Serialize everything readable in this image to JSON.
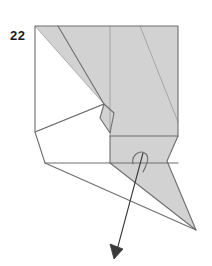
{
  "diagram": {
    "kind": "origami-folding-step",
    "step_number": "22",
    "caption": "",
    "colors": {
      "paper_front": "#d2d2d2",
      "paper_back": "#ffffff",
      "fold_line": "#6e6e6e",
      "crease_line": "#9a9a9a",
      "outline": "#555555",
      "arrow": "#3a3a3a",
      "background": "#ffffff",
      "number_text": "#1a1a1a"
    },
    "shapes": {
      "body_upper_gray": "35,26 178,26 178,136 110,136 110,111 104,104",
      "body_left_white": "35,26 35,132 45,163 110,163 110,136 104,104",
      "body_lower_gray": "110,136 178,136 167,161 196,230 110,163",
      "tail_white": "45,163 196,230 110,163",
      "upper_left_gray_wedge": "35,26 104,104 58,26",
      "diamond_flap": "104,104 114,112 110,133 100,118",
      "hook_flap": "133,163 141,152 148,157 143,164"
    },
    "lines": {
      "outline_main": "35,26 178,26 178,136 167,161 196,230 45,163 35,132 35,26",
      "crease_vertical": "110,26 110,163",
      "crease_diag_upper": "58,26 110,136",
      "crease_diag_right": "140,26 178,120",
      "crease_left_fan_a": "35,26 35,132",
      "crease_left_fan_b": "35,132 104,104",
      "crease_left_fan_c": "35,26 104,104",
      "crease_tail_edge": "45,163 196,230",
      "crease_tail_inner": "110,163 196,230",
      "horizontal_mid": "35,132 110,136",
      "horizontal_lower": "45,163 178,163"
    },
    "arrow": {
      "type": "fold-arrow",
      "from": "142,155",
      "to": "114,257",
      "head": "solid-triangle"
    }
  }
}
